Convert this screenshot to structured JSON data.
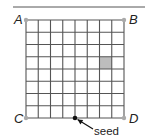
{
  "diagram": {
    "type": "grid-field",
    "grid": {
      "columns": 8,
      "rows": 8,
      "origin_x": 26,
      "origin_y": 20,
      "cell_size": 12.25,
      "line_color": "#555555",
      "line_width": 1.1
    },
    "top_rule": {
      "x1": 13,
      "x2": 145,
      "y": 7,
      "color": "#555555"
    },
    "corners": [
      {
        "id": "A",
        "label": "A",
        "col": 0,
        "row": 0,
        "label_dx": -12,
        "label_dy": 4
      },
      {
        "id": "B",
        "label": "B",
        "col": 8,
        "row": 0,
        "label_dx": 5,
        "label_dy": 4
      },
      {
        "id": "C",
        "label": "C",
        "col": 0,
        "row": 8,
        "label_dx": -12,
        "label_dy": 5
      },
      {
        "id": "D",
        "label": "D",
        "col": 8,
        "row": 8,
        "label_dx": 5,
        "label_dy": 5
      }
    ],
    "corner_dot_color": "#aaaaaa",
    "shaded_cell": {
      "col": 6,
      "row": 3,
      "color": "#bdbdbd"
    },
    "seed": {
      "label": "seed",
      "col": 4,
      "row": 8,
      "dot_color": "#111111",
      "arrow_from": [
        93,
        129
      ],
      "label_x": 94,
      "label_y": 135
    }
  }
}
